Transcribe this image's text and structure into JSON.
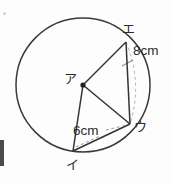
{
  "figure": {
    "type": "circle-geometry-diagram",
    "background_color": "#fdfdfd",
    "stroke_color": "#333333",
    "dashed_color": "#9a9a9a",
    "circle": {
      "center_label": "ア",
      "center_x": 83,
      "center_y": 85,
      "radius": 67
    },
    "points": [
      {
        "id": "a",
        "label": "ア",
        "role": "center",
        "x": 83,
        "y": 85
      },
      {
        "id": "i",
        "label": "イ",
        "role": "on-circle",
        "x": 73,
        "y": 151
      },
      {
        "id": "u",
        "label": "ウ",
        "role": "on-circle",
        "x": 130,
        "y": 124
      },
      {
        "id": "e",
        "label": "エ",
        "role": "on-circle",
        "x": 126,
        "y": 42
      }
    ],
    "segments": [
      {
        "name": "radius-a-e",
        "from": "a",
        "to": "e",
        "style": "solid"
      },
      {
        "name": "radius-a-u",
        "from": "a",
        "to": "u",
        "style": "solid"
      },
      {
        "name": "radius-a-i",
        "from": "a",
        "to": "i",
        "style": "solid"
      },
      {
        "name": "chord-e-u",
        "from": "e",
        "to": "u",
        "style": "solid"
      },
      {
        "name": "chord-i-u",
        "from": "i",
        "to": "u",
        "style": "solid"
      }
    ],
    "dimensions": [
      {
        "name": "chord-e-u-length",
        "text": "8cm",
        "applies_to": "chord-e-u"
      },
      {
        "name": "chord-i-u-length",
        "text": "6cm",
        "applies_to": "chord-i-u"
      }
    ],
    "guides": [
      {
        "name": "dashed-arc-e-u",
        "style": "dashed",
        "description": "dashed arc from エ to ウ"
      },
      {
        "name": "dashed-leader-8cm",
        "style": "dashed",
        "description": "leader from 8cm label to chord エウ"
      },
      {
        "name": "dashed-leader-6cm",
        "style": "dashed",
        "description": "leader from 6cm label to ウ"
      },
      {
        "name": "dashed-guide-i",
        "style": "dashed",
        "description": "dashed guide from イ toward ウ"
      }
    ]
  },
  "labels": {
    "point_a": "ア",
    "point_i": "イ",
    "point_u": "ウ",
    "point_e": "エ",
    "dim_8cm": "8cm",
    "dim_6cm": "6cm"
  }
}
